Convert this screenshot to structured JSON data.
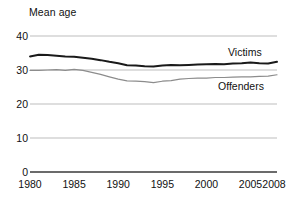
{
  "chart_data": {
    "type": "line",
    "title": "",
    "ylabel": "Mean age",
    "xlabel": "",
    "ylim": [
      0,
      40
    ],
    "xlim": [
      1980,
      2008
    ],
    "yticks": [
      "0",
      "10",
      "20",
      "30",
      "40"
    ],
    "ytick_values": [
      0,
      10,
      20,
      30,
      40
    ],
    "xticks": [
      "1980",
      "1985",
      "1990",
      "1995",
      "2000",
      "2005",
      "2008"
    ],
    "xtick_values": [
      1980,
      1985,
      1990,
      1995,
      2000,
      2005,
      2008
    ],
    "grid": "horizontal",
    "legend_position": "inline-right",
    "x": [
      1980,
      1981,
      1982,
      1983,
      1984,
      1985,
      1986,
      1987,
      1988,
      1989,
      1990,
      1991,
      1992,
      1993,
      1994,
      1995,
      1996,
      1997,
      1998,
      1999,
      2000,
      2001,
      2002,
      2003,
      2004,
      2005,
      2006,
      2007,
      2008
    ],
    "series": [
      {
        "name": "Victims",
        "color": "#1a1a1a",
        "width": 2.0,
        "values": [
          34.0,
          34.5,
          34.4,
          34.2,
          34.0,
          33.9,
          33.6,
          33.3,
          32.9,
          32.4,
          32.0,
          31.4,
          31.3,
          31.1,
          31.0,
          31.3,
          31.5,
          31.4,
          31.5,
          31.6,
          31.7,
          31.8,
          31.7,
          31.9,
          32.0,
          32.2,
          32.0,
          31.9,
          32.4
        ]
      },
      {
        "name": "Offenders",
        "color": "#8c8c8c",
        "width": 1.2,
        "values": [
          29.9,
          29.9,
          30.0,
          30.1,
          29.9,
          30.2,
          29.9,
          29.3,
          28.7,
          28.0,
          27.3,
          26.8,
          26.7,
          26.6,
          26.3,
          26.7,
          26.9,
          27.3,
          27.5,
          27.6,
          27.6,
          27.8,
          27.8,
          27.9,
          28.0,
          28.0,
          28.1,
          28.2,
          28.6
        ]
      }
    ],
    "annotations": [
      {
        "text": "Victims",
        "series": "Victims"
      },
      {
        "text": "Offenders",
        "series": "Offenders"
      }
    ]
  },
  "style": {
    "grid_color": "#b5b5b5",
    "axis_color": "#3a3a3a",
    "text_color": "#111111"
  }
}
